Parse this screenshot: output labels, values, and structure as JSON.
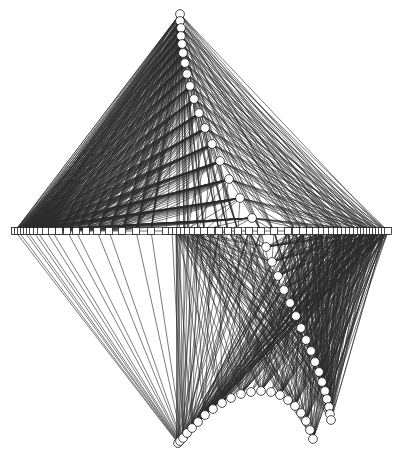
{
  "figure": {
    "title": "",
    "background_color": "#ffffff",
    "width": 399,
    "height": 464
  },
  "style": {
    "edge_color": "#2b2b2b",
    "edge_faint_color": "#8d8d8d",
    "node_stroke_color": "#1c1c1c",
    "node_fill_color": "#ffffff",
    "axis_color": "#3a3a3a",
    "edge_width": 0.62,
    "node_stroke_width": 0.78,
    "square_size": 7,
    "circle_radius": 4.4
  },
  "chart_data": {
    "type": "diagram",
    "subtype": "node-link-string-art",
    "title": "",
    "xlabel": "",
    "ylabel": "",
    "grid": false,
    "legend": null,
    "axis": {
      "baseline_y": 231,
      "baseline_x_start": 14,
      "baseline_x_end": 390,
      "vertical_guide_x": [
        176.5,
        179.5
      ],
      "vertical_guide_y_start": 14,
      "vertical_guide_y_end": 448
    },
    "node_shapes": [
      "square",
      "circle"
    ],
    "square_nodes_x": [
      15,
      18,
      21,
      24,
      27,
      30,
      33,
      37,
      41,
      46,
      52,
      59,
      67,
      76,
      86,
      97,
      109,
      122,
      136,
      151,
      166,
      172,
      176,
      180,
      184,
      188,
      193,
      198,
      204,
      211,
      219,
      228,
      238,
      249,
      261,
      274,
      288,
      296,
      303,
      310,
      316,
      322,
      327,
      332,
      337,
      341,
      345,
      349,
      353,
      357,
      361,
      364,
      367,
      370,
      373,
      376,
      379,
      382,
      385,
      388
    ],
    "upper_arc_circles": [
      {
        "x": 180,
        "y": 14
      },
      {
        "x": 180,
        "y": 21
      },
      {
        "x": 181,
        "y": 28
      },
      {
        "x": 181,
        "y": 36
      },
      {
        "x": 182,
        "y": 44
      },
      {
        "x": 183,
        "y": 53
      },
      {
        "x": 185,
        "y": 63
      },
      {
        "x": 187,
        "y": 74
      },
      {
        "x": 190,
        "y": 86
      },
      {
        "x": 194,
        "y": 99
      },
      {
        "x": 199,
        "y": 113
      },
      {
        "x": 205,
        "y": 128
      },
      {
        "x": 212,
        "y": 144
      },
      {
        "x": 220,
        "y": 161
      },
      {
        "x": 229,
        "y": 179
      },
      {
        "x": 240,
        "y": 198
      },
      {
        "x": 252,
        "y": 218
      }
    ],
    "lower_arc_circles": [
      {
        "x": 266,
        "y": 247
      },
      {
        "x": 272,
        "y": 262
      },
      {
        "x": 278,
        "y": 276
      },
      {
        "x": 284,
        "y": 290
      },
      {
        "x": 290,
        "y": 303
      },
      {
        "x": 296,
        "y": 316
      },
      {
        "x": 301,
        "y": 328
      },
      {
        "x": 306,
        "y": 340
      },
      {
        "x": 311,
        "y": 351
      },
      {
        "x": 315,
        "y": 362
      },
      {
        "x": 319,
        "y": 372
      },
      {
        "x": 322,
        "y": 382
      },
      {
        "x": 325,
        "y": 391
      },
      {
        "x": 327,
        "y": 399
      },
      {
        "x": 329,
        "y": 407
      },
      {
        "x": 330,
        "y": 414
      },
      {
        "x": 331,
        "y": 420
      }
    ],
    "bottom_arc_circles": [
      {
        "x": 178,
        "y": 443
      },
      {
        "x": 180,
        "y": 441
      },
      {
        "x": 183,
        "y": 438
      },
      {
        "x": 187,
        "y": 433
      },
      {
        "x": 192,
        "y": 428
      },
      {
        "x": 198,
        "y": 422
      },
      {
        "x": 205,
        "y": 415
      },
      {
        "x": 213,
        "y": 409
      },
      {
        "x": 222,
        "y": 403
      },
      {
        "x": 231,
        "y": 398
      },
      {
        "x": 241,
        "y": 394
      },
      {
        "x": 251,
        "y": 392
      },
      {
        "x": 261,
        "y": 391
      },
      {
        "x": 271,
        "y": 392
      },
      {
        "x": 280,
        "y": 395
      },
      {
        "x": 288,
        "y": 400
      },
      {
        "x": 295,
        "y": 406
      },
      {
        "x": 301,
        "y": 413
      },
      {
        "x": 306,
        "y": 421
      },
      {
        "x": 310,
        "y": 430
      },
      {
        "x": 313,
        "y": 439
      }
    ],
    "edge_bundles": [
      {
        "name": "upper-left-fan",
        "from": "upper_arc_circles",
        "to_x_start": 15,
        "to_x_end": 166,
        "description": "lines from upper circles down-left to baseline squares forming concave envelope"
      },
      {
        "name": "upper-right-fan",
        "from": "upper_arc_circles",
        "to_x_start": 180,
        "to_x_end": 390,
        "description": "lines from upper circles down-right to baseline squares"
      },
      {
        "name": "lower-right-fan",
        "from": "lower_arc_circles",
        "to_x_start": 180,
        "to_x_end": 390,
        "description": "lines from lower-right circles up to baseline squares"
      },
      {
        "name": "bottom-fan",
        "from": "bottom_arc_circles",
        "to_x_start": 180,
        "to_x_end": 390,
        "description": "lines from bottom arc circles up to baseline squares"
      },
      {
        "name": "cusp-left-bundle",
        "from": "baseline-left-cluster",
        "to": "bottom-apex",
        "description": "converging bundle through left cusp near x=30"
      }
    ]
  }
}
